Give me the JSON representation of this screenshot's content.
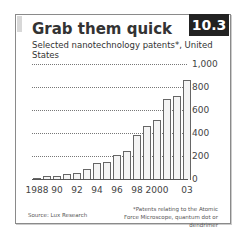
{
  "header": {
    "title": "Grab them quick",
    "subtitle": "Selected nanotechnology patents*, United States",
    "badge": "10.3"
  },
  "footer": {
    "source": "Source: Lux Research",
    "note": "*Patents relating to the Atomic Force Microscope, quantum dot or dendrimer"
  },
  "chart_data": {
    "type": "bar",
    "title": "Grab them quick",
    "subtitle": "Selected nanotechnology patents*, United States",
    "xlabel": "",
    "ylabel": "",
    "categories": [
      "1988",
      "1989",
      "1990",
      "1991",
      "1992",
      "1993",
      "1994",
      "1995",
      "1996",
      "1997",
      "1998",
      "1999",
      "2000",
      "2001",
      "2002",
      "2003"
    ],
    "values": [
      5,
      25,
      25,
      40,
      55,
      90,
      140,
      150,
      205,
      240,
      385,
      460,
      510,
      700,
      720,
      860
    ],
    "x_tick_labels": [
      "1988",
      "90",
      "92",
      "94",
      "96",
      "98",
      "2000",
      "03"
    ],
    "y_ticks": [
      0,
      200,
      400,
      600,
      800,
      1000
    ],
    "y_tick_labels": [
      "0",
      "200",
      "400",
      "600",
      "800",
      "1,000"
    ],
    "ylim": [
      0,
      1000
    ],
    "grid": true,
    "y_axis_position": "right",
    "colors": {
      "bar_fill": "#f4f4f4",
      "bar_edge": "#666666",
      "badge": "#222222"
    }
  }
}
